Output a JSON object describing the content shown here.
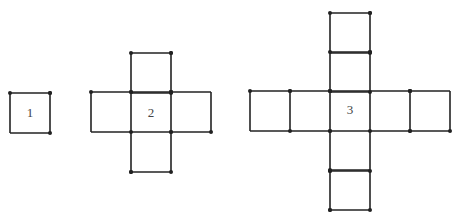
{
  "stroke_color": "#222222",
  "figures": [
    {
      "label": "1",
      "label_pos": [
        30,
        113
      ],
      "squares": [
        [
          10,
          93
        ]
      ],
      "size": 40
    },
    {
      "label": "2",
      "label_pos": [
        151,
        113
      ],
      "squares": [
        [
          131,
          53
        ],
        [
          91,
          92
        ],
        [
          131,
          92
        ],
        [
          171,
          92
        ],
        [
          131,
          132
        ]
      ],
      "size": 40
    },
    {
      "label": "3",
      "label_pos": [
        350,
        110
      ],
      "squares": [
        [
          330,
          13
        ],
        [
          330,
          52
        ],
        [
          250,
          91
        ],
        [
          290,
          91
        ],
        [
          330,
          91
        ],
        [
          370,
          91
        ],
        [
          410,
          91
        ],
        [
          330,
          131
        ],
        [
          330,
          170
        ]
      ],
      "size": 40
    }
  ]
}
